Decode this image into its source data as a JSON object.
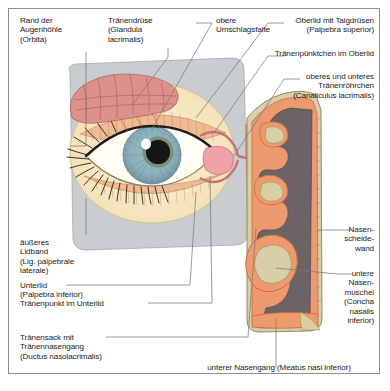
{
  "figure": {
    "frame_color": "#8d8d8d",
    "background": "#ffffff"
  },
  "palette": {
    "skin": "#c9cdd0",
    "eyelid": "#f5e3bc",
    "lid_inner": "#eebb95",
    "sclera": "#fffdf4",
    "iris": "#8fb3bd",
    "iris_ring": "#7c8a6a",
    "pupil": "#161616",
    "highlight": "#ffffff",
    "lacrimal_gland": "#d98a84",
    "lacrimal_sac": "#f2a0a6",
    "mucosa": "#ef9a6e",
    "cavity": "#6b6366",
    "bone": "#d8cfa8",
    "leader": "#7a7a7a"
  },
  "labels": {
    "orbita": "Rand der\nAugenhöhle\n(Orbita)",
    "lacrimal_gland": "Tränendrüse\n(Glandula\nlacrimalis)",
    "upper_fornix": "obere\nUmschlagsfalte",
    "upper_lid": "Oberlid mit Talgdrüsen\n(Palpebra superior)",
    "punctum_upper": "Tränenpünktchen im Oberlid",
    "canaliculi": "oberes und unteres\nTränenröhrchen\n(Canaliculus lacrimalis)",
    "lateral_ligament": "äußeres\nLidband\n(Lig. palpebrale\nlaterale)",
    "lower_lid": "Unterlid\n(Palpebra inferior)",
    "punctum_lower": "Tränenpunkt im Unterlid",
    "lacrimal_sac": "Tränensack mit\nTränennasengang\n(Ductus nasolacrimalis)",
    "nasal_septum": "Nasen-\nscheide-\nwand",
    "inferior_concha": "untere\nNasen-\nmuschel\n(Concha\nnasalis\ninferior)",
    "inferior_meatus": "unterer Nasengang (Meatus nasi inferior)"
  }
}
